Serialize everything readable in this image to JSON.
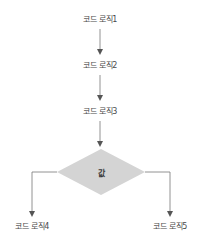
{
  "diagram": {
    "type": "flowchart",
    "nodes": [
      {
        "id": "step1",
        "label": "코드 로직1"
      },
      {
        "id": "step2",
        "label": "코드 로직2"
      },
      {
        "id": "step3",
        "label": "코드 로직3"
      },
      {
        "id": "decision",
        "label": "값",
        "shape": "diamond"
      },
      {
        "id": "step4",
        "label": "코드 로직4"
      },
      {
        "id": "step5",
        "label": "코드 로직5"
      }
    ],
    "edges": [
      {
        "from": "step1",
        "to": "step2"
      },
      {
        "from": "step2",
        "to": "step3"
      },
      {
        "from": "step3",
        "to": "decision"
      },
      {
        "from": "decision",
        "to": "step4",
        "direction": "left"
      },
      {
        "from": "decision",
        "to": "step5",
        "direction": "right"
      }
    ],
    "colors": {
      "line": "#777777",
      "diamond_fill": "#d4d4d4",
      "text": "#4a4a4a"
    }
  }
}
